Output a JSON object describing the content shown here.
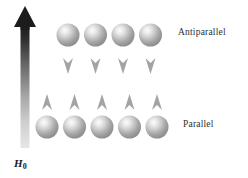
{
  "figure": {
    "name": "nuclear-spin-alignment-diagram",
    "background_color": "#ffffff",
    "width": 248,
    "height": 178
  },
  "field_arrow": {
    "symbol": "H",
    "subscript": "0",
    "direction": "up",
    "color_top": "#1c1c1c",
    "color_bottom": "#dedede"
  },
  "rows": [
    {
      "id": "antiparallel",
      "label": "Antiparallel",
      "spin_direction": "down",
      "count": 4,
      "arrow_color": "#a0a0a0",
      "sphere_color": "#b8b8b8",
      "centers_x": [
        68,
        95.5,
        123,
        150.5
      ],
      "center_y": 35
    },
    {
      "id": "parallel",
      "label": "Parallel",
      "spin_direction": "up",
      "count": 5,
      "arrow_color": "#a0a0a0",
      "sphere_color": "#b8b8b8",
      "centers_x": [
        47,
        74.5,
        102,
        129.5,
        157
      ],
      "center_y": 127
    }
  ]
}
